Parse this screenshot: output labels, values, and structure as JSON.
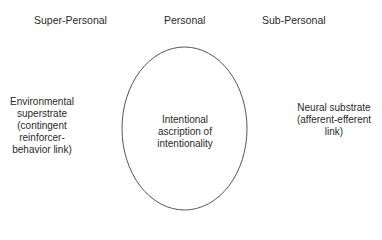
{
  "headers": {
    "left": "Super-Personal",
    "center": "Personal",
    "right": "Sub-Personal"
  },
  "left_label": [
    "Environmental",
    "superstrate",
    "(contingent",
    "reinforcer-",
    "behavior link)"
  ],
  "center_label": [
    "Intentional",
    "ascription of",
    "intentionality"
  ],
  "right_label": [
    "Neural substrate",
    "(afferent-efferent",
    "link)"
  ],
  "ellipse": {
    "cx": 184.5,
    "cy": 128.5,
    "rx": 62.5,
    "ry": 81.5,
    "stroke": "#555555"
  }
}
